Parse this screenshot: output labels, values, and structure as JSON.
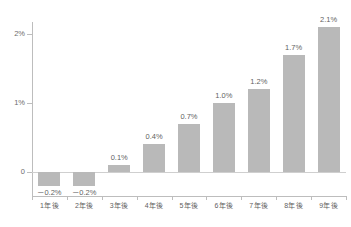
{
  "chart_data": {
    "type": "bar",
    "title": "",
    "subtitle": "",
    "xlabel": "",
    "ylabel": "",
    "categories": [
      "1年後",
      "2年後",
      "3年後",
      "4年後",
      "5年後",
      "6年後",
      "7年後",
      "8年後",
      "9年後"
    ],
    "values": [
      -0.2,
      -0.2,
      0.1,
      0.4,
      0.7,
      1.0,
      1.2,
      1.7,
      2.1
    ],
    "value_labels": [
      "－0.2%",
      "－0.2%",
      "0.1%",
      "0.4%",
      "0.7%",
      "1.0%",
      "1.2%",
      "1.7%",
      "2.1%"
    ],
    "ylim": [
      -0.45,
      2.3
    ],
    "y_ticks": [
      0,
      1,
      2
    ],
    "y_tick_labels": [
      "0",
      "1%",
      "2%"
    ],
    "grid": false,
    "legend": null,
    "legend_position": "none",
    "series": [
      {
        "name": "",
        "values": [
          -0.2,
          -0.2,
          0.1,
          0.4,
          0.7,
          1.0,
          1.2,
          1.7,
          2.1
        ]
      }
    ],
    "colors": {
      "bar": "#b9b9b9",
      "axis": "#bdbdbd",
      "zero_line": "#cfcfcf",
      "tick_label": "#6d6d6d",
      "value_label": "#5f5f5f",
      "background": "#ffffff"
    }
  }
}
